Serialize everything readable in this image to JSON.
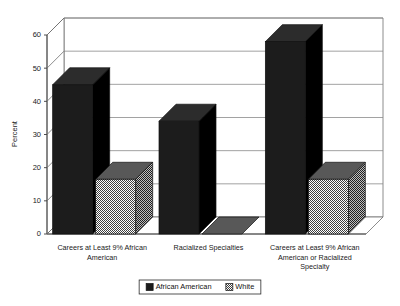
{
  "chart_data": {
    "type": "bar",
    "title": "",
    "subtitle": "",
    "xlabel": "",
    "ylabel": "Percent",
    "ylim": [
      0,
      60
    ],
    "yticks": [
      0,
      10,
      20,
      30,
      40,
      50,
      60
    ],
    "ytick_labels": [
      "0",
      "10",
      "20",
      "30",
      "40",
      "50",
      "60"
    ],
    "grid": true,
    "three_d": true,
    "legend_position": "bottom-center",
    "categories": [
      "Careers at Least 9% African American",
      "Racialized Specialties",
      "Careers at Least 9% African American or Racialized Specialty"
    ],
    "category_lines": [
      [
        "Careers at Least 9% African",
        "American"
      ],
      [
        "Racialized Specialties"
      ],
      [
        "Careers at Least 9% African",
        "American or Racialized",
        "Specialty"
      ]
    ],
    "series": [
      {
        "name": "African American",
        "color": "#1c1c1c",
        "values": [
          45,
          34,
          58
        ]
      },
      {
        "name": "White",
        "color": "#7c7c7c",
        "values": [
          16.5,
          0,
          16.5
        ]
      }
    ]
  },
  "legend": {
    "items": [
      {
        "label": "African American",
        "swatch": "#1c1c1c"
      },
      {
        "label": "White",
        "swatch": "#7c7c7c"
      }
    ]
  },
  "colors": {
    "background": "#ffffff",
    "gridline": "#8a8a8a",
    "axis": "#3a3a3a",
    "series_african_american": "#1c1c1c",
    "series_white": "#7c7c7c",
    "bar_outline": "#111111"
  }
}
